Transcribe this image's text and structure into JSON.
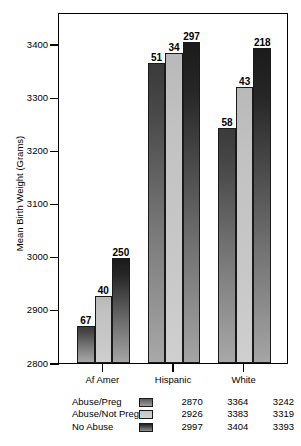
{
  "chart_data": {
    "type": "bar",
    "title": "",
    "xlabel": "",
    "ylabel": "Mean Birth Weight (Grams)",
    "ylim": [
      2800,
      3440
    ],
    "yticks": [
      2800,
      2900,
      3000,
      3100,
      3200,
      3300,
      3400
    ],
    "ytick_labels": [
      "2800",
      "2900",
      "3000",
      "3100",
      "3200",
      "3300",
      "3400"
    ],
    "grid": false,
    "legend_position": "bottom",
    "categories": [
      "Af Amer",
      "Hispanic",
      "White"
    ],
    "series": [
      {
        "name": "Abuse/Preg",
        "values": [
          2870,
          3364,
          3242
        ],
        "labels": [
          "2870",
          "3364",
          "3242"
        ],
        "counts": [
          67,
          51,
          58
        ],
        "count_labels": [
          "67",
          "51",
          "58"
        ],
        "color": "#4a4a4a"
      },
      {
        "name": "Abuse/Not Preg",
        "values": [
          2926,
          3383,
          3319
        ],
        "labels": [
          "2926",
          "3383",
          "3319"
        ],
        "counts": [
          40,
          34,
          43
        ],
        "count_labels": [
          "40",
          "34",
          "43"
        ],
        "color": "#c8c8c8"
      },
      {
        "name": "No Abuse",
        "values": [
          2997,
          3404,
          3393
        ],
        "labels": [
          "2997",
          "3404",
          "3393"
        ],
        "counts": [
          250,
          297,
          218
        ],
        "count_labels": [
          "250",
          "297",
          "218"
        ],
        "color": "#262626"
      }
    ],
    "bar_annotation_meaning": "sample size (n) above each bar"
  },
  "legend_table": {
    "rows": [
      {
        "label": "Abuse/Preg",
        "values": [
          "2870",
          "3364",
          "3242"
        ]
      },
      {
        "label": "Abuse/Not Preg",
        "values": [
          "2926",
          "3383",
          "3319"
        ]
      },
      {
        "label": "No Abuse",
        "values": [
          "2997",
          "3404",
          "3393"
        ]
      }
    ]
  }
}
